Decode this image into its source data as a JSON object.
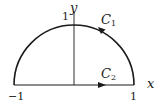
{
  "diagram": {
    "title": "",
    "type": "contour-plot",
    "axes": {
      "x_label": "x",
      "y_label": "y",
      "tick_labels": {
        "x_min": "−1",
        "x_max": "1",
        "y_max": "1"
      }
    },
    "curves": [
      {
        "name": "C",
        "sub": "1",
        "description": "upper unit semicircle, counterclockwise from (1,0) to (−1,0)"
      },
      {
        "name": "C",
        "sub": "2",
        "description": "segment on x-axis from −1 to 1, directed rightward"
      }
    ],
    "colors": {
      "stroke": "#1a1a1a",
      "background": "#ffffff"
    }
  }
}
